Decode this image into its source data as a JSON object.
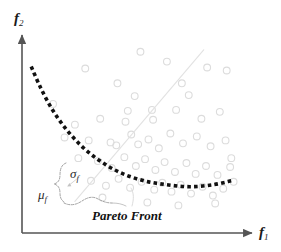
{
  "figure": {
    "kind": "pareto-front-scatter-diagram",
    "caption": "Pareto Front",
    "background_color": "#ffffff"
  },
  "axes": {
    "x": {
      "label": "f",
      "subscript": "1",
      "arrow": true,
      "color": "#555555",
      "start": [
        22,
        233
      ],
      "end": [
        255,
        233
      ]
    },
    "y": {
      "label": "f",
      "subscript": "2",
      "arrow": true,
      "color": "#555555",
      "start": [
        22,
        233
      ],
      "end": [
        22,
        33
      ]
    }
  },
  "annotations": {
    "sigma": {
      "label": "σ",
      "subscript": "f",
      "color": "#2a2a2a"
    },
    "mu": {
      "label": "μ",
      "subscript": "f",
      "color": "#2a2a2a"
    },
    "front_caption": "Pareto Front"
  },
  "colors": {
    "axis": "#555555",
    "front_dashes": "#111111",
    "scatter_stroke": "#dcdcdc",
    "trend_line": "#e2e2e2",
    "brace": "#9a9a9a",
    "text": "#111111"
  },
  "chart_data": {
    "type": "scatter",
    "title": "",
    "xlabel": "f1",
    "ylabel": "f2",
    "xlim": [
      0,
      100
    ],
    "ylim": [
      0,
      100
    ],
    "grid": false,
    "legend": null,
    "series": [
      {
        "name": "candidate solutions",
        "marker": "open-circle",
        "color": "#dcdcdc",
        "points": [
          [
            27.5,
            83.5
          ],
          [
            51.5,
            92.0
          ],
          [
            41.5,
            76.0
          ],
          [
            49.0,
            69.5
          ],
          [
            63.0,
            87.0
          ],
          [
            69.5,
            76.0
          ],
          [
            80.5,
            84.0
          ],
          [
            89.0,
            82.5
          ],
          [
            13.5,
            65.5
          ],
          [
            23.0,
            55.0
          ],
          [
            34.0,
            58.0
          ],
          [
            45.0,
            56.5
          ],
          [
            56.5,
            62.5
          ],
          [
            57.0,
            57.5
          ],
          [
            67.0,
            62.5
          ],
          [
            72.5,
            70.0
          ],
          [
            78.0,
            58.0
          ],
          [
            86.0,
            61.5
          ],
          [
            18.5,
            48.5
          ],
          [
            29.0,
            47.0
          ],
          [
            38.5,
            46.0
          ],
          [
            41.0,
            44.5
          ],
          [
            47.5,
            50.0
          ],
          [
            50.5,
            45.0
          ],
          [
            55.0,
            47.5
          ],
          [
            59.5,
            43.0
          ],
          [
            64.5,
            50.5
          ],
          [
            70.0,
            45.5
          ],
          [
            76.0,
            49.0
          ],
          [
            82.0,
            44.0
          ],
          [
            88.5,
            47.0
          ],
          [
            24.5,
            38.0
          ],
          [
            33.0,
            36.5
          ],
          [
            39.0,
            33.0
          ],
          [
            44.5,
            38.5
          ],
          [
            49.5,
            34.0
          ],
          [
            53.5,
            37.5
          ],
          [
            58.0,
            32.0
          ],
          [
            62.0,
            36.0
          ],
          [
            66.5,
            31.0
          ],
          [
            71.5,
            35.5
          ],
          [
            75.5,
            30.0
          ],
          [
            80.0,
            34.0
          ],
          [
            85.0,
            29.5
          ],
          [
            90.5,
            33.5
          ],
          [
            30.0,
            26.5
          ],
          [
            36.5,
            24.0
          ],
          [
            42.0,
            27.5
          ],
          [
            47.0,
            23.0
          ],
          [
            52.0,
            26.0
          ],
          [
            57.5,
            22.0
          ],
          [
            61.0,
            25.5
          ],
          [
            65.0,
            21.0
          ],
          [
            69.0,
            24.5
          ],
          [
            73.5,
            20.0
          ],
          [
            78.5,
            23.5
          ],
          [
            83.0,
            19.0
          ],
          [
            87.5,
            22.5
          ],
          [
            92.0,
            26.0
          ],
          [
            35.0,
            18.0
          ],
          [
            54.5,
            15.5
          ],
          [
            68.0,
            14.0
          ],
          [
            84.0,
            15.0
          ],
          [
            91.0,
            38.0
          ],
          [
            46.0,
            62.0
          ]
        ]
      }
    ],
    "reference_curves": [
      {
        "name": "Pareto front",
        "style": "heavy-dotted",
        "color": "#111111",
        "points": [
          [
            4.0,
            84.5
          ],
          [
            8.0,
            74.0
          ],
          [
            13.0,
            63.0
          ],
          [
            19.0,
            53.0
          ],
          [
            26.0,
            44.0
          ],
          [
            34.0,
            36.5
          ],
          [
            43.0,
            30.5
          ],
          [
            53.0,
            26.5
          ],
          [
            63.0,
            24.5
          ],
          [
            73.0,
            23.5
          ],
          [
            83.0,
            24.5
          ],
          [
            91.0,
            26.5
          ]
        ]
      },
      {
        "name": "diagonal trend line",
        "style": "thin-solid",
        "color": "#e2e2e2",
        "points": [
          [
            23.0,
            16.0
          ],
          [
            79.0,
            93.0
          ]
        ]
      }
    ]
  }
}
